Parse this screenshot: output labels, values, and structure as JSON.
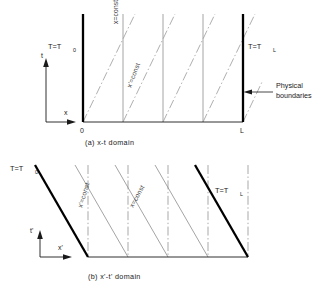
{
  "figure": {
    "panels": [
      {
        "id": "panel-a",
        "caption": "(a)  x-t  domain",
        "axis_x_label": "x",
        "axis_y_label": "t",
        "origin_tick": "0",
        "right_tick": "L",
        "left_boundary_label": "T=T",
        "left_boundary_sub": "0",
        "right_boundary_label": "T=T",
        "right_boundary_sub": "L",
        "vertical_family_label": "x=const",
        "diagonal_family_label": "x'=const",
        "annotation_line1": "Physical",
        "annotation_line2": "boundaries"
      },
      {
        "id": "panel-b",
        "caption": "(b)  x'-t'  domain",
        "axis_x_label": "x'",
        "axis_y_label": "t'",
        "left_boundary_label": "T=T",
        "left_boundary_sub": "0",
        "right_boundary_label": "T=T",
        "right_boundary_sub": "L",
        "slanted_family_label": "x'=const",
        "diagonal_family_label": "x=const"
      }
    ],
    "colors": {
      "ink": "#1a1a1a",
      "boundary": "#000000",
      "thin_line": "#8d8d8d",
      "dashdot_line": "#9a9a9a",
      "background": "#ffffff"
    }
  }
}
